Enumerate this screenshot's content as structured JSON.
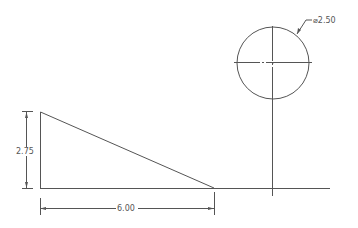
{
  "drawing": {
    "dimensions": {
      "height_label": "2.75",
      "width_label": "6.00",
      "diameter_label": "⌀2.50"
    },
    "colors": {
      "line": "#555555",
      "background": "#ffffff"
    }
  }
}
